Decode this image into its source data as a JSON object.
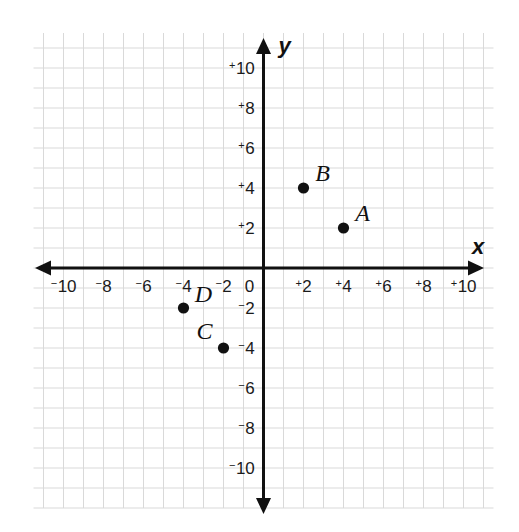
{
  "chart_data": {
    "type": "scatter",
    "title": "",
    "xlabel": "x",
    "ylabel": "y",
    "xlim": [
      -10,
      10
    ],
    "ylim": [
      -10,
      10
    ],
    "grid": true,
    "grid_step": 1,
    "tick_step": 2,
    "legend": "none",
    "x_ticks": [
      {
        "value": -10,
        "label": "10",
        "sign": "−"
      },
      {
        "value": -8,
        "label": "8",
        "sign": "−"
      },
      {
        "value": -6,
        "label": "6",
        "sign": "−"
      },
      {
        "value": -4,
        "label": "4",
        "sign": "−"
      },
      {
        "value": -2,
        "label": "2",
        "sign": "−"
      },
      {
        "value": 0,
        "label": "0",
        "sign": ""
      },
      {
        "value": 2,
        "label": "2",
        "sign": "+"
      },
      {
        "value": 4,
        "label": "4",
        "sign": "+"
      },
      {
        "value": 6,
        "label": "6",
        "sign": "+"
      },
      {
        "value": 8,
        "label": "8",
        "sign": "+"
      },
      {
        "value": 10,
        "label": "10",
        "sign": "+"
      }
    ],
    "y_ticks": [
      {
        "value": 10,
        "label": "10",
        "sign": "+"
      },
      {
        "value": 8,
        "label": "8",
        "sign": "+"
      },
      {
        "value": 6,
        "label": "6",
        "sign": "+"
      },
      {
        "value": 4,
        "label": "4",
        "sign": "+"
      },
      {
        "value": 2,
        "label": "2",
        "sign": "+"
      },
      {
        "value": -2,
        "label": "2",
        "sign": "−"
      },
      {
        "value": -4,
        "label": "4",
        "sign": "−"
      },
      {
        "value": -6,
        "label": "6",
        "sign": "−"
      },
      {
        "value": -8,
        "label": "8",
        "sign": "−"
      },
      {
        "value": -10,
        "label": "10",
        "sign": "−"
      }
    ],
    "points": [
      {
        "name": "A",
        "x": 4,
        "y": 2,
        "label_dx": 0.95,
        "label_dy": 0.75
      },
      {
        "name": "B",
        "x": 2,
        "y": 4,
        "label_dx": 0.95,
        "label_dy": 0.75
      },
      {
        "name": "C",
        "x": -2,
        "y": -4,
        "label_dx": -0.95,
        "label_dy": 0.85
      },
      {
        "name": "D",
        "x": -4,
        "y": -2,
        "label_dx": 1.0,
        "label_dy": 0.7
      }
    ]
  },
  "style": {
    "background": "#ffffff",
    "grid_color": "#d9d9d9",
    "axis_color": "#111111",
    "point_color": "#111111",
    "text_color": "#1a1a1a"
  }
}
